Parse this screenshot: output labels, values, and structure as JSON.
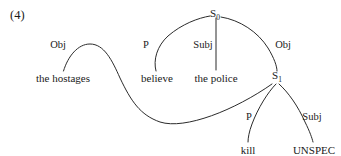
{
  "figure": {
    "example_number": "(4)",
    "type": "relational-grammar-stratal-diagram",
    "background_color": "#ffffff",
    "line_color": "#2b2b2b"
  },
  "nodes": [
    {
      "id": "S0",
      "base": "S",
      "subscript": "0",
      "x": 215,
      "y": 16
    },
    {
      "id": "S1",
      "base": "S",
      "subscript": "1",
      "x": 277,
      "y": 78
    }
  ],
  "terminals": [
    {
      "id": "the-hostages",
      "text": "the hostages",
      "x": 63,
      "y": 78
    },
    {
      "id": "believe",
      "text": "believe",
      "x": 157,
      "y": 78
    },
    {
      "id": "the-police",
      "text": "the police",
      "x": 216,
      "y": 78
    },
    {
      "id": "kill",
      "text": "kill",
      "x": 248,
      "y": 150
    },
    {
      "id": "UNSPEC",
      "text": "UNSPEC",
      "x": 314,
      "y": 150
    }
  ],
  "relations": [
    {
      "id": "obj-hostages",
      "label": "Obj",
      "from": "S1",
      "to": "the-hostages",
      "x": 58,
      "y": 45
    },
    {
      "id": "p-believe",
      "label": "P",
      "from": "S0",
      "to": "believe",
      "x": 146,
      "y": 45
    },
    {
      "id": "subj-police",
      "label": "Subj",
      "from": "S0",
      "to": "the-police",
      "x": 203,
      "y": 45
    },
    {
      "id": "obj-s1",
      "label": "Obj",
      "from": "S0",
      "to": "S1",
      "x": 283,
      "y": 45
    },
    {
      "id": "p-kill",
      "label": "P",
      "from": "S1",
      "to": "kill",
      "x": 249,
      "y": 117
    },
    {
      "id": "subj-unspec",
      "label": "Subj",
      "from": "S1",
      "to": "UNSPEC",
      "x": 312,
      "y": 117
    }
  ],
  "arcs": [
    {
      "id": "arc-obj-hostages",
      "d": "M 63.5 71 C 68 56 78 44 90 44 C 104 44 112 60 120 78 C 131 101 140 115 160 122 C 185 130 235 110 272 84"
    },
    {
      "id": "arc-p-believe",
      "d": "M 156 71 C 153 60 157 46 168 36 C 182 24 198 18 210 16"
    },
    {
      "id": "arc-subj-police",
      "d": "M 216 70 L 216 18"
    },
    {
      "id": "arc-obj-s1",
      "d": "M 221 17 C 240 20 258 32 268 48 C 274 58 277 66 277 71"
    },
    {
      "id": "arc-p-kill",
      "d": "M 276 84 C 268 92 258 108 252 124 C 249 132 248 138 248 142"
    },
    {
      "id": "arc-subj-unspec",
      "d": "M 279 84 C 288 92 298 106 305 122 C 310 132 312 138 313 142"
    }
  ]
}
